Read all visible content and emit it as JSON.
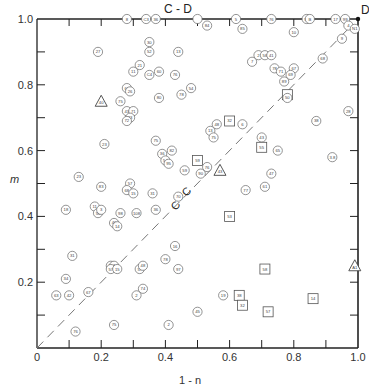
{
  "chart_data": {
    "type": "scatter",
    "title": "",
    "xlabel": "1 - n",
    "ylabel": "m",
    "xlim": [
      0,
      1.0
    ],
    "ylim": [
      0,
      1.0
    ],
    "x_ticks": [
      "0",
      "0.2",
      "0.4",
      "0.6",
      "0.8",
      "1.0"
    ],
    "x_tick_values": [
      0,
      0.2,
      0.4,
      0.6,
      0.8,
      1.0
    ],
    "y_ticks": [
      "0.2",
      "0.4",
      "0.6",
      "0.8",
      "1.0"
    ],
    "y_tick_values": [
      0.2,
      0.4,
      0.6,
      0.8,
      1.0
    ],
    "minor_tick_step": 0.1,
    "grid": false,
    "legend": null,
    "annotations": [
      {
        "text": "C - D",
        "x": 0.5,
        "y": 1.04
      },
      {
        "text": "D",
        "x": 1.02,
        "y": 1.02
      },
      {
        "text": "C - C",
        "x": 0.43,
        "y": 0.44,
        "rotation": -45
      }
    ],
    "reference_lines": [
      {
        "name": "C-C diagonal",
        "style": "dashed",
        "from": [
          0,
          0
        ],
        "to": [
          1,
          1
        ]
      }
    ],
    "marker_shapes": {
      "circle": "numbered specimen (circle)",
      "square": "numbered specimen (square)",
      "triangle": "numbered specimen (triangle)"
    },
    "points": [
      {
        "x": 0.28,
        "y": 1.0,
        "shape": "circle",
        "label": "8"
      },
      {
        "x": 0.34,
        "y": 1.0,
        "shape": "circle",
        "label": "C3"
      },
      {
        "x": 0.37,
        "y": 1.0,
        "shape": "circle",
        "label": "36"
      },
      {
        "x": 0.5,
        "y": 1.0,
        "shape": "circle",
        "label": ""
      },
      {
        "x": 0.62,
        "y": 1.0,
        "shape": "circle",
        "label": "5"
      },
      {
        "x": 0.73,
        "y": 1.0,
        "shape": "circle",
        "label": "76"
      },
      {
        "x": 0.84,
        "y": 1.0,
        "shape": "circle",
        "label": "95"
      },
      {
        "x": 0.85,
        "y": 1.0,
        "shape": "circle",
        "label": "B"
      },
      {
        "x": 0.93,
        "y": 1.0,
        "shape": "circle",
        "label": "17"
      },
      {
        "x": 0.96,
        "y": 1.0,
        "shape": "circle",
        "label": "99"
      },
      {
        "x": 0.97,
        "y": 0.98,
        "shape": "circle",
        "label": "4"
      },
      {
        "x": 0.99,
        "y": 0.97,
        "shape": "circle",
        "label": "N1"
      },
      {
        "x": 0.95,
        "y": 0.94,
        "shape": "circle",
        "label": "9"
      },
      {
        "x": 0.53,
        "y": 0.98,
        "shape": "circle",
        "label": "84"
      },
      {
        "x": 0.64,
        "y": 0.97,
        "shape": "circle",
        "label": "85"
      },
      {
        "x": 0.8,
        "y": 0.96,
        "shape": "circle",
        "label": "10"
      },
      {
        "x": 0.19,
        "y": 0.9,
        "shape": "circle",
        "label": "27"
      },
      {
        "x": 0.35,
        "y": 0.93,
        "shape": "circle",
        "label": "30"
      },
      {
        "x": 0.35,
        "y": 0.9,
        "shape": "circle",
        "label": "52"
      },
      {
        "x": 0.44,
        "y": 0.9,
        "shape": "circle",
        "label": "13"
      },
      {
        "x": 0.32,
        "y": 0.86,
        "shape": "circle",
        "label": "21"
      },
      {
        "x": 0.3,
        "y": 0.84,
        "shape": "circle",
        "label": "11"
      },
      {
        "x": 0.35,
        "y": 0.83,
        "shape": "circle",
        "label": "C4"
      },
      {
        "x": 0.38,
        "y": 0.84,
        "shape": "circle",
        "label": "60"
      },
      {
        "x": 0.43,
        "y": 0.83,
        "shape": "circle",
        "label": "76"
      },
      {
        "x": 0.69,
        "y": 0.89,
        "shape": "circle",
        "label": "2"
      },
      {
        "x": 0.71,
        "y": 0.89,
        "shape": "circle",
        "label": "58"
      },
      {
        "x": 0.73,
        "y": 0.89,
        "shape": "circle",
        "label": "41"
      },
      {
        "x": 0.67,
        "y": 0.87,
        "shape": "circle",
        "label": "7"
      },
      {
        "x": 0.89,
        "y": 0.88,
        "shape": "circle",
        "label": "68"
      },
      {
        "x": 0.74,
        "y": 0.85,
        "shape": "circle",
        "label": "78"
      },
      {
        "x": 0.76,
        "y": 0.84,
        "shape": "circle",
        "label": "71"
      },
      {
        "x": 0.8,
        "y": 0.85,
        "shape": "circle",
        "label": "67"
      },
      {
        "x": 0.79,
        "y": 0.83,
        "shape": "circle",
        "label": "69"
      },
      {
        "x": 0.77,
        "y": 0.81,
        "shape": "circle",
        "label": "89"
      },
      {
        "x": 0.78,
        "y": 0.77,
        "shape": "square",
        "label": "8"
      },
      {
        "x": 0.78,
        "y": 0.76,
        "shape": "circle",
        "label": "50"
      },
      {
        "x": 0.48,
        "y": 0.79,
        "shape": "circle",
        "label": "54"
      },
      {
        "x": 0.28,
        "y": 0.79,
        "shape": "circle",
        "label": "62"
      },
      {
        "x": 0.29,
        "y": 0.78,
        "shape": "circle",
        "label": "26"
      },
      {
        "x": 0.2,
        "y": 0.75,
        "shape": "triangle",
        "label": "40"
      },
      {
        "x": 0.26,
        "y": 0.75,
        "shape": "circle",
        "label": "75"
      },
      {
        "x": 0.38,
        "y": 0.76,
        "shape": "circle",
        "label": "80"
      },
      {
        "x": 0.45,
        "y": 0.77,
        "shape": "circle",
        "label": "78"
      },
      {
        "x": 0.28,
        "y": 0.72,
        "shape": "circle",
        "label": "43"
      },
      {
        "x": 0.3,
        "y": 0.72,
        "shape": "circle",
        "label": "71"
      },
      {
        "x": 0.29,
        "y": 0.7,
        "shape": "circle",
        "label": "33"
      },
      {
        "x": 0.28,
        "y": 0.69,
        "shape": "circle",
        "label": "72"
      },
      {
        "x": 0.97,
        "y": 0.72,
        "shape": "circle",
        "label": "28"
      },
      {
        "x": 0.87,
        "y": 0.69,
        "shape": "circle",
        "label": "38"
      },
      {
        "x": 0.6,
        "y": 0.69,
        "shape": "square",
        "label": "32"
      },
      {
        "x": 0.64,
        "y": 0.68,
        "shape": "circle",
        "label": "6"
      },
      {
        "x": 0.7,
        "y": 0.64,
        "shape": "circle",
        "label": "43"
      },
      {
        "x": 0.56,
        "y": 0.68,
        "shape": "circle",
        "label": "48"
      },
      {
        "x": 0.54,
        "y": 0.66,
        "shape": "circle",
        "label": "13"
      },
      {
        "x": 0.55,
        "y": 0.64,
        "shape": "circle",
        "label": "75"
      },
      {
        "x": 0.21,
        "y": 0.62,
        "shape": "circle",
        "label": "23"
      },
      {
        "x": 0.37,
        "y": 0.63,
        "shape": "circle",
        "label": "75"
      },
      {
        "x": 0.42,
        "y": 0.6,
        "shape": "circle",
        "label": "82"
      },
      {
        "x": 0.39,
        "y": 0.59,
        "shape": "circle",
        "label": "36"
      },
      {
        "x": 0.4,
        "y": 0.57,
        "shape": "circle",
        "label": "54"
      },
      {
        "x": 0.41,
        "y": 0.56,
        "shape": "circle",
        "label": "95"
      },
      {
        "x": 0.5,
        "y": 0.57,
        "shape": "square",
        "label": "59"
      },
      {
        "x": 0.53,
        "y": 0.55,
        "shape": "circle",
        "label": "76"
      },
      {
        "x": 0.46,
        "y": 0.54,
        "shape": "circle",
        "label": "59"
      },
      {
        "x": 0.51,
        "y": 0.53,
        "shape": "circle",
        "label": "90"
      },
      {
        "x": 0.57,
        "y": 0.54,
        "shape": "triangle",
        "label": "43"
      },
      {
        "x": 0.7,
        "y": 0.61,
        "shape": "square",
        "label": "55"
      },
      {
        "x": 0.75,
        "y": 0.6,
        "shape": "circle",
        "label": "65"
      },
      {
        "x": 0.92,
        "y": 0.58,
        "shape": "circle",
        "label": "3.8"
      },
      {
        "x": 0.73,
        "y": 0.53,
        "shape": "circle",
        "label": "47"
      },
      {
        "x": 0.71,
        "y": 0.49,
        "shape": "circle",
        "label": "61"
      },
      {
        "x": 0.13,
        "y": 0.52,
        "shape": "circle",
        "label": "23"
      },
      {
        "x": 0.2,
        "y": 0.49,
        "shape": "circle",
        "label": "83"
      },
      {
        "x": 0.29,
        "y": 0.5,
        "shape": "circle",
        "label": "57"
      },
      {
        "x": 0.28,
        "y": 0.48,
        "shape": "circle",
        "label": "68"
      },
      {
        "x": 0.3,
        "y": 0.47,
        "shape": "circle",
        "label": "15"
      },
      {
        "x": 0.36,
        "y": 0.47,
        "shape": "circle",
        "label": "31"
      },
      {
        "x": 0.44,
        "y": 0.46,
        "shape": "circle",
        "label": "70"
      },
      {
        "x": 0.18,
        "y": 0.43,
        "shape": "circle",
        "label": "11"
      },
      {
        "x": 0.09,
        "y": 0.42,
        "shape": "circle",
        "label": "18"
      },
      {
        "x": 0.19,
        "y": 0.41,
        "shape": "circle",
        "label": "56"
      },
      {
        "x": 0.2,
        "y": 0.42,
        "shape": "circle",
        "label": "3"
      },
      {
        "x": 0.26,
        "y": 0.41,
        "shape": "circle",
        "label": "98"
      },
      {
        "x": 0.31,
        "y": 0.41,
        "shape": "circle",
        "label": "108"
      },
      {
        "x": 0.37,
        "y": 0.42,
        "shape": "circle",
        "label": "36"
      },
      {
        "x": 0.24,
        "y": 0.38,
        "shape": "circle",
        "label": "46"
      },
      {
        "x": 0.25,
        "y": 0.37,
        "shape": "circle",
        "label": "14"
      },
      {
        "x": 0.65,
        "y": 0.48,
        "shape": "circle",
        "label": "77"
      },
      {
        "x": 0.6,
        "y": 0.4,
        "shape": "square",
        "label": "53"
      },
      {
        "x": 0.43,
        "y": 0.31,
        "shape": "circle",
        "label": "16"
      },
      {
        "x": 0.11,
        "y": 0.28,
        "shape": "circle",
        "label": "31"
      },
      {
        "x": 0.23,
        "y": 0.25,
        "shape": "circle",
        "label": "65"
      },
      {
        "x": 0.24,
        "y": 0.25,
        "shape": "circle",
        "label": "7"
      },
      {
        "x": 0.23,
        "y": 0.24,
        "shape": "circle",
        "label": "57"
      },
      {
        "x": 0.25,
        "y": 0.24,
        "shape": "circle",
        "label": "15"
      },
      {
        "x": 0.32,
        "y": 0.24,
        "shape": "circle",
        "label": "57"
      },
      {
        "x": 0.33,
        "y": 0.25,
        "shape": "circle",
        "label": "48"
      },
      {
        "x": 0.44,
        "y": 0.24,
        "shape": "circle",
        "label": "97"
      },
      {
        "x": 0.4,
        "y": 0.27,
        "shape": "circle",
        "label": "78"
      },
      {
        "x": 0.09,
        "y": 0.21,
        "shape": "circle",
        "label": "34"
      },
      {
        "x": 0.06,
        "y": 0.16,
        "shape": "circle",
        "label": "63"
      },
      {
        "x": 0.1,
        "y": 0.16,
        "shape": "circle",
        "label": "42"
      },
      {
        "x": 0.16,
        "y": 0.17,
        "shape": "circle",
        "label": "67"
      },
      {
        "x": 0.33,
        "y": 0.18,
        "shape": "circle",
        "label": "74"
      },
      {
        "x": 0.31,
        "y": 0.16,
        "shape": "circle",
        "label": "2"
      },
      {
        "x": 0.24,
        "y": 0.07,
        "shape": "circle",
        "label": "75"
      },
      {
        "x": 0.12,
        "y": 0.05,
        "shape": "circle",
        "label": "76"
      },
      {
        "x": 0.41,
        "y": 0.07,
        "shape": "circle",
        "label": "2"
      },
      {
        "x": 0.5,
        "y": 0.11,
        "shape": "circle",
        "label": "45"
      },
      {
        "x": 0.58,
        "y": 0.16,
        "shape": "circle",
        "label": "19"
      },
      {
        "x": 0.63,
        "y": 0.16,
        "shape": "square",
        "label": "38"
      },
      {
        "x": 0.64,
        "y": 0.13,
        "shape": "square",
        "label": "32"
      },
      {
        "x": 0.71,
        "y": 0.24,
        "shape": "square",
        "label": "58"
      },
      {
        "x": 0.72,
        "y": 0.11,
        "shape": "square",
        "label": "57"
      },
      {
        "x": 0.86,
        "y": 0.15,
        "shape": "square",
        "label": "14"
      },
      {
        "x": 0.99,
        "y": 0.25,
        "shape": "triangle",
        "label": "A1"
      }
    ]
  },
  "axes": {
    "x_title": "1 - n",
    "y_title": "m",
    "origin_label": "0"
  },
  "annotations": {
    "top_edge": "C - D",
    "corner": "D",
    "diagonal": "C - C"
  }
}
